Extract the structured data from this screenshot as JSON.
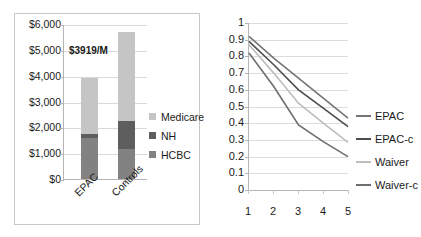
{
  "chart_data": [
    {
      "type": "bar",
      "subtype": "stacked-column",
      "title": "",
      "xlabel": "",
      "ylabel": "",
      "categories": [
        "EPAC",
        "Controls"
      ],
      "series": [
        {
          "name": "HCBC",
          "values": [
            1600,
            1150
          ],
          "color": "#828282"
        },
        {
          "name": "NH",
          "values": [
            150,
            1100
          ],
          "color": "#5e5e5e"
        },
        {
          "name": "Medicare",
          "values": [
            2169,
            3450
          ],
          "color": "#c5c5c5"
        }
      ],
      "totals": [
        3919,
        5700
      ],
      "ylim": [
        0,
        6000
      ],
      "yticks": [
        0,
        1000,
        2000,
        3000,
        4000,
        5000,
        6000
      ],
      "ytick_labels": [
        "$0",
        "$1,000",
        "$2,000",
        "$3,000",
        "$4,000",
        "$5,000",
        "$6,000"
      ],
      "grid": true,
      "legend_position": "right",
      "legend_order": [
        "Medicare",
        "NH",
        "HCBC"
      ],
      "annotations": [
        {
          "text": "$3919/M",
          "target": "EPAC"
        }
      ]
    },
    {
      "type": "line",
      "title": "",
      "xlabel": "",
      "ylabel": "",
      "x": [
        1,
        2,
        3,
        4,
        5
      ],
      "xtick_labels": [
        "1",
        "2",
        "3",
        "4",
        "5"
      ],
      "ylim": [
        0,
        1
      ],
      "yticks": [
        0,
        0.1,
        0.2,
        0.3,
        0.4,
        0.5,
        0.6,
        0.7,
        0.8,
        0.9,
        1
      ],
      "ytick_labels": [
        "0",
        "0.1",
        "0.2",
        "0.3",
        "0.4",
        "0.5",
        "0.6",
        "0.7",
        "0.8",
        "0.9",
        "1"
      ],
      "grid": true,
      "legend_position": "right",
      "series": [
        {
          "name": "EPAC",
          "values": [
            0.92,
            0.79,
            0.67,
            0.55,
            0.43
          ],
          "color": "#757575"
        },
        {
          "name": "EPAC-c",
          "values": [
            0.89,
            0.75,
            0.6,
            0.49,
            0.38
          ],
          "color": "#4d4d4d"
        },
        {
          "name": "Waiver",
          "values": [
            0.87,
            0.7,
            0.52,
            0.4,
            0.285
          ],
          "color": "#bdbdbd"
        },
        {
          "name": "Waiver-c",
          "values": [
            0.82,
            0.62,
            0.39,
            0.29,
            0.2
          ],
          "color": "#6e6e6e"
        }
      ]
    }
  ]
}
